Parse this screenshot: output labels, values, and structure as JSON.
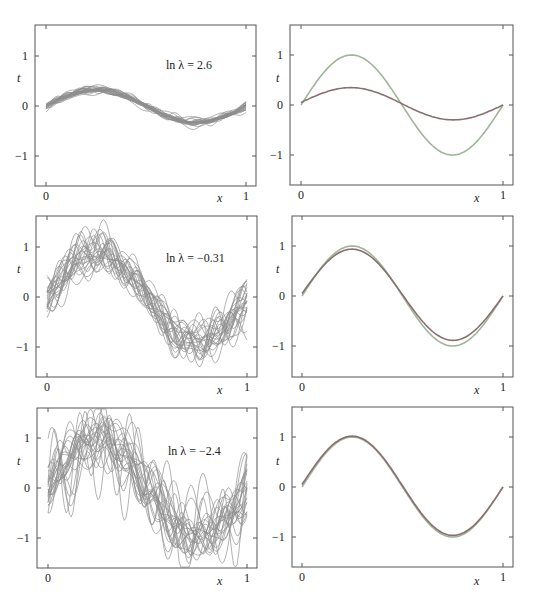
{
  "chart_data": [
    {
      "type": "line",
      "panel": "top-left",
      "annotation": "ln λ = 2.6",
      "xlabel": "x",
      "ylabel": "t",
      "xlim": [
        0,
        1
      ],
      "ylim": [
        -1.6,
        1.6
      ],
      "xticks": [
        "0",
        "1"
      ],
      "yticks": [
        "-1",
        "0",
        "1"
      ],
      "series_description": "25 regularized basis-function fits, strongly smoothed (low variance, high bias)",
      "num_fits": 25,
      "amplitude": 0.33,
      "noise": 0.06,
      "wiggle": 0.02
    },
    {
      "type": "line",
      "panel": "top-right",
      "xlabel": "x",
      "ylabel": "t",
      "xlim": [
        0,
        1
      ],
      "ylim": [
        -1.6,
        1.6
      ],
      "xticks": [
        "0",
        "1"
      ],
      "yticks": [
        "-1",
        "0",
        "1"
      ],
      "series": [
        {
          "name": "sin(2πx)",
          "color": "#9fb59a",
          "amplitude": 1.0
        },
        {
          "name": "average fit",
          "color": "#8a6f72",
          "amplitude": 0.31
        }
      ]
    },
    {
      "type": "line",
      "panel": "middle-left",
      "annotation": "ln λ = −0.31",
      "xlabel": "x",
      "ylabel": "t",
      "xlim": [
        0,
        1
      ],
      "ylim": [
        -1.6,
        1.6
      ],
      "xticks": [
        "0",
        "1"
      ],
      "yticks": [
        "-1",
        "0",
        "1"
      ],
      "series_description": "25 regularized basis-function fits, moderate regularization",
      "num_fits": 25,
      "amplitude": 0.88,
      "noise": 0.14,
      "wiggle": 0.12
    },
    {
      "type": "line",
      "panel": "middle-right",
      "xlabel": "x",
      "ylabel": "t",
      "xlim": [
        0,
        1
      ],
      "ylim": [
        -1.6,
        1.6
      ],
      "xticks": [
        "0",
        "1"
      ],
      "yticks": [
        "-1",
        "0",
        "1"
      ],
      "series": [
        {
          "name": "sin(2πx)",
          "color": "#9fb59a",
          "amplitude": 1.0
        },
        {
          "name": "average fit",
          "color": "#8a6f72",
          "amplitude": 0.9
        }
      ]
    },
    {
      "type": "line",
      "panel": "bottom-left",
      "annotation": "ln λ = −2.4",
      "xlabel": "x",
      "ylabel": "t",
      "xlim": [
        0,
        1
      ],
      "ylim": [
        -1.6,
        1.6
      ],
      "xticks": [
        "0",
        "1"
      ],
      "yticks": [
        "-1",
        "0",
        "1"
      ],
      "series_description": "25 regularized basis-function fits, weak regularization (high variance, low bias)",
      "num_fits": 25,
      "amplitude": 0.97,
      "noise": 0.2,
      "wiggle": 0.22
    },
    {
      "type": "line",
      "panel": "bottom-right",
      "xlabel": "x",
      "ylabel": "t",
      "xlim": [
        0,
        1
      ],
      "ylim": [
        -1.6,
        1.6
      ],
      "xticks": [
        "0",
        "1"
      ],
      "yticks": [
        "-1",
        "0",
        "1"
      ],
      "series": [
        {
          "name": "sin(2πx)",
          "color": "#9fb59a",
          "amplitude": 1.0
        },
        {
          "name": "average fit",
          "color": "#8a6f72",
          "amplitude": 0.98
        }
      ]
    }
  ],
  "labels": {
    "x_axis": "x",
    "y_axis": "t",
    "tick_0": "0",
    "tick_1": "1",
    "ytick_pos": "1",
    "ytick_zero": "0",
    "ytick_neg": "−1",
    "annot_top": "ln λ = 2.6",
    "annot_mid": "ln λ = −0.31",
    "annot_bot": "ln λ = −2.4"
  },
  "colors": {
    "fit_lines": "#8d8d8d",
    "true_curve": "#9fb59a",
    "average_curve": "#8a6f72",
    "frame": "#555555"
  }
}
